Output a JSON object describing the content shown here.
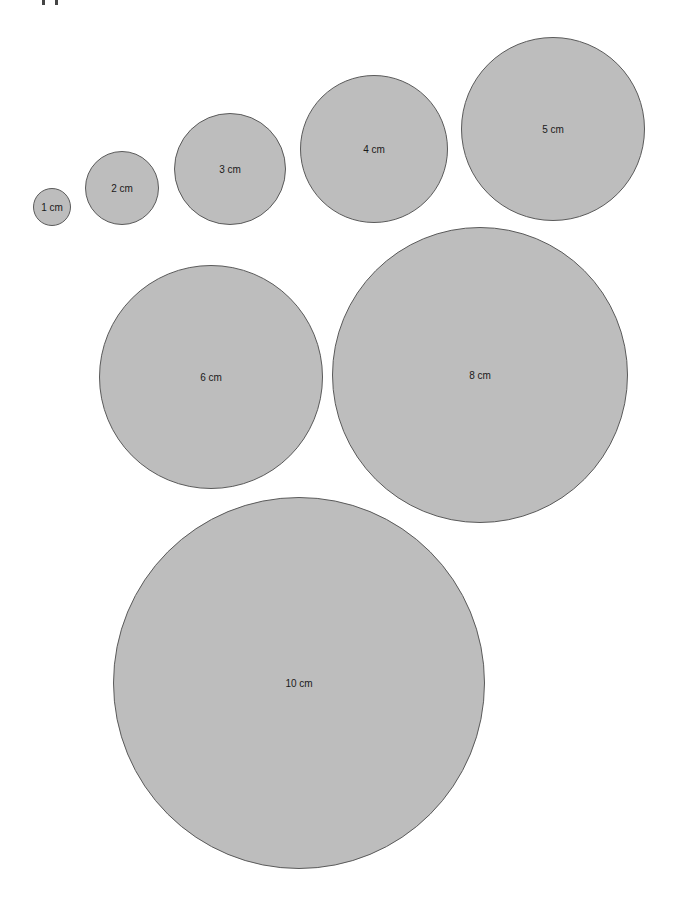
{
  "page": {
    "background": "#ffffff",
    "circle_fill": "#bdbdbd",
    "circle_stroke": "#5a5a5a"
  },
  "circles": [
    {
      "label": "1 cm",
      "cx": 52,
      "cy": 207,
      "r": 19
    },
    {
      "label": "2 cm",
      "cx": 122,
      "cy": 188,
      "r": 37
    },
    {
      "label": "3 cm",
      "cx": 230,
      "cy": 169,
      "r": 56
    },
    {
      "label": "4 cm",
      "cx": 374,
      "cy": 149,
      "r": 74
    },
    {
      "label": "5 cm",
      "cx": 553,
      "cy": 129,
      "r": 92
    },
    {
      "label": "6 cm",
      "cx": 211,
      "cy": 377,
      "r": 112
    },
    {
      "label": "8 cm",
      "cx": 480,
      "cy": 375,
      "r": 148
    },
    {
      "label": "10 cm",
      "cx": 299,
      "cy": 683,
      "r": 186
    }
  ]
}
